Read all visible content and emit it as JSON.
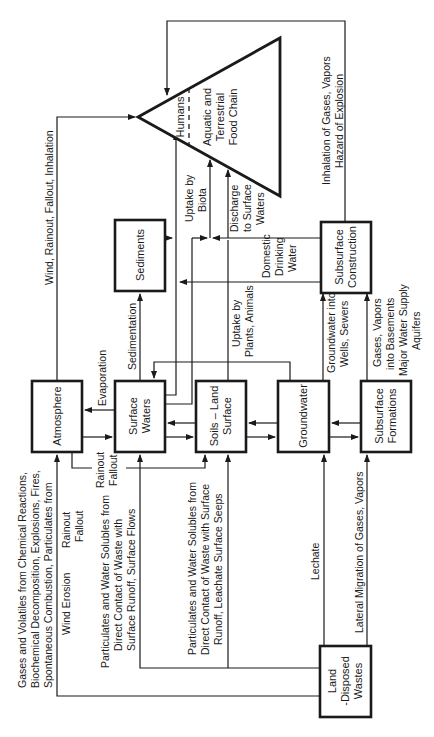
{
  "diagram": {
    "orientation": "rotated 90 degrees counterclockwise",
    "nodes": {
      "atmosphere": "Atmosphere",
      "surface_waters": [
        "Surface",
        "Waters"
      ],
      "soils_land_surface": [
        "Soils – Land",
        "Surface"
      ],
      "groundwater": "Groundwater",
      "subsurface_formations": [
        "Subsurface",
        "Formations"
      ],
      "sediments": "Sediments",
      "subsurface_construction": [
        "Subsurface",
        "Construction"
      ],
      "land_disposed_wastes": [
        "Land",
        "-Disposed",
        "Wastes"
      ],
      "food_chain": {
        "humans": "Humans",
        "aquatic": [
          "Aquatic and",
          "Terrestrial",
          "Food Chain"
        ]
      }
    },
    "edge_labels": {
      "gases_volatiles": [
        "Gases and Volatiles from Chemical Reactions,",
        "Biochemical Decomposition, Explosions, Fires,",
        "Spontaneous Combustion, Particulates from"
      ],
      "wind_erosion": "Wind Erosion",
      "rainout_fallout_left": [
        "Rainout",
        "Fallout"
      ],
      "particulates_surface_flows": [
        "Particulates and Water Solubles from",
        "Direct Contact of Waste with",
        "Surface Runoff, Surface Flows"
      ],
      "particulates_leachate": [
        "Particulates and Water Solubles from",
        "Direct Contact of Waste with Surface",
        "Runoff, Leachate Surface Seeps"
      ],
      "lechate": "Lechate",
      "lateral_migration": "Lateral Migration of Gases, Vapors",
      "rainout_fallout_mid": [
        "Rainout",
        "Fallout"
      ],
      "evaporation": "Evaporation",
      "sedimentation": "Sedimentation",
      "wind_rainout_inhalation": "Wind, Rainout, Fallout, Inhalation",
      "uptake_biota": [
        "Uptake by",
        "Biota"
      ],
      "discharge_surface_waters": [
        "Discharge",
        "to Surface",
        "Waters"
      ],
      "domestic_drinking_water": [
        "Domestic",
        "Drinking",
        "Water"
      ],
      "uptake_plants_animals": [
        "Uptake by",
        "Plants, Animals"
      ],
      "groundwater_wells": [
        "Groundwater into",
        "Wells, Sewers"
      ],
      "gases_vapors_basements": [
        "Gases, Vapors",
        "into Basements",
        "Major Water Supply",
        "Aquifers"
      ],
      "inhalation_explosion": [
        "Inhalation of Gases, Vapors",
        "Hazard of Explosion"
      ]
    },
    "colors": {
      "ink": "#1a1a1a",
      "background": "#ffffff"
    }
  }
}
